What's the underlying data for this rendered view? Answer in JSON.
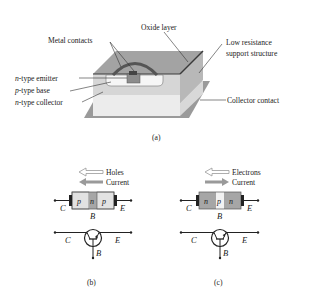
{
  "figure_a": {
    "caption": "(a)",
    "labels": {
      "oxide_layer": "Oxide layer",
      "metal_contacts": "Metal contacts",
      "low_resistance_1": "Low resistance",
      "low_resistance_2": "support structure",
      "emitter_prefix": "n",
      "emitter_suffix": "-type emitter",
      "base_prefix": "p",
      "base_suffix": "-type base",
      "collector_prefix": "n",
      "collector_suffix": "-type collector",
      "collector_contact": "Collector contact"
    }
  },
  "figure_b": {
    "caption": "(b)",
    "legend": {
      "holes": "Holes",
      "current": "Current"
    },
    "regions": [
      "p",
      "n",
      "p"
    ],
    "terminals": {
      "collector": "C",
      "base": "B",
      "emitter": "E"
    },
    "type": "pnp"
  },
  "figure_c": {
    "caption": "(c)",
    "legend": {
      "electrons": "Electrons",
      "current": "Current"
    },
    "regions": [
      "n",
      "p",
      "n"
    ],
    "terminals": {
      "collector": "C",
      "base": "B",
      "emitter": "E"
    },
    "type": "npn"
  },
  "colors": {
    "dark_gray": "#7a7a7a",
    "mid_gray": "#a8a8a8",
    "light_gray": "#d4d4d4",
    "very_light": "#ececec",
    "n_region_dark": "#a6a6a6",
    "p_region_light": "#e2e2e2",
    "line": "#1a1a1a"
  }
}
